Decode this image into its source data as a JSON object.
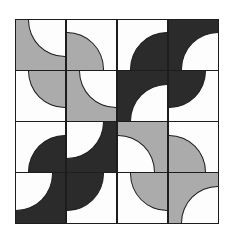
{
  "artwork": {
    "title": "Four-by-four quarter-circle quilt block",
    "canvas": {
      "width": 232,
      "height": 243,
      "background": "#ffffff"
    },
    "grid": {
      "rows": 4,
      "columns": 4,
      "left": 15,
      "top": 19,
      "width": 204,
      "height": 205
    },
    "palette": {
      "light": "#fdfdfd",
      "gray": "#ababab",
      "dark": "#2b2b2b",
      "outline": "#1d1d1d"
    },
    "tiles": [
      {
        "row": 0,
        "col": 0,
        "background": "gray",
        "arc": "white",
        "corner": "tr"
      },
      {
        "row": 0,
        "col": 1,
        "background": "light",
        "arc": "gray",
        "corner": "bl"
      },
      {
        "row": 0,
        "col": 2,
        "background": "light",
        "arc": "dark",
        "corner": "br"
      },
      {
        "row": 0,
        "col": 3,
        "background": "dark",
        "arc": "white",
        "corner": "br"
      },
      {
        "row": 1,
        "col": 0,
        "background": "light",
        "arc": "gray",
        "corner": "tr"
      },
      {
        "row": 1,
        "col": 1,
        "background": "gray",
        "arc": "white",
        "corner": "tr"
      },
      {
        "row": 1,
        "col": 2,
        "background": "dark",
        "arc": "white",
        "corner": "br"
      },
      {
        "row": 1,
        "col": 3,
        "background": "light",
        "arc": "dark",
        "corner": "tl"
      },
      {
        "row": 2,
        "col": 0,
        "background": "light",
        "arc": "dark",
        "corner": "br"
      },
      {
        "row": 2,
        "col": 1,
        "background": "dark",
        "arc": "white",
        "corner": "tl"
      },
      {
        "row": 2,
        "col": 2,
        "background": "gray",
        "arc": "white",
        "corner": "bl"
      },
      {
        "row": 2,
        "col": 3,
        "background": "light",
        "arc": "gray",
        "corner": "bl"
      },
      {
        "row": 3,
        "col": 0,
        "background": "dark",
        "arc": "white",
        "corner": "tl"
      },
      {
        "row": 3,
        "col": 1,
        "background": "light",
        "arc": "dark",
        "corner": "tl"
      },
      {
        "row": 3,
        "col": 2,
        "background": "light",
        "arc": "gray",
        "corner": "tr"
      },
      {
        "row": 3,
        "col": 3,
        "background": "gray",
        "arc": "white",
        "corner": "br"
      }
    ]
  }
}
